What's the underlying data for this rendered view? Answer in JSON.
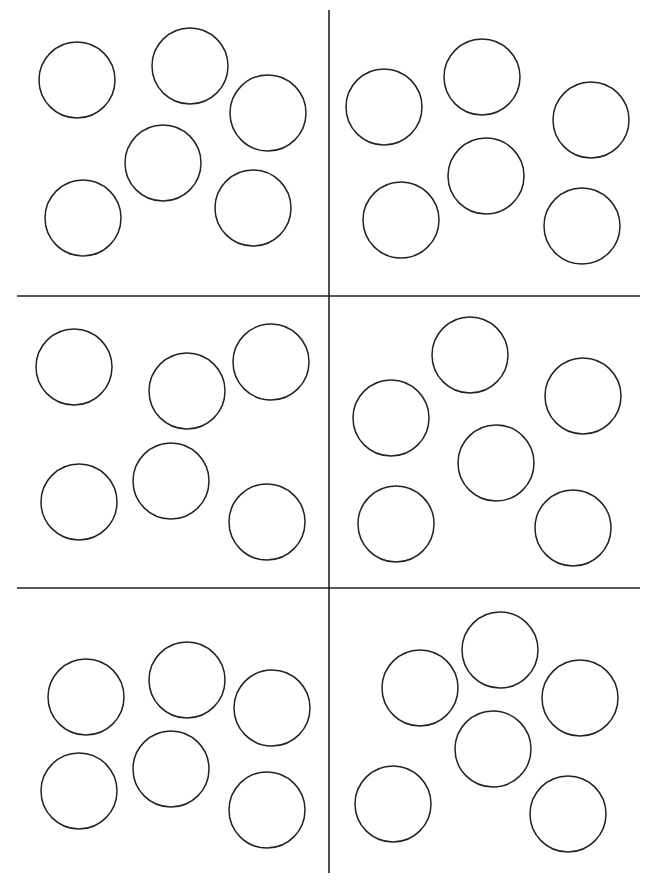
{
  "page": {
    "width": 656,
    "height": 887,
    "background": "#ffffff",
    "stroke_color": "#222222"
  },
  "grid_lines": [
    {
      "id": "vertical-divider",
      "x1": 329,
      "y1": 10,
      "x2": 329,
      "y2": 873
    },
    {
      "id": "horizontal-divider-top",
      "x1": 17,
      "y1": 296,
      "x2": 640,
      "y2": 296
    },
    {
      "id": "horizontal-divider-bottom",
      "x1": 17,
      "y1": 588,
      "x2": 640,
      "y2": 588
    }
  ],
  "circle_radius": 38,
  "panels": [
    {
      "name": "panel-top-left",
      "circles": [
        [
          77,
          80
        ],
        [
          190,
          66
        ],
        [
          268,
          113
        ],
        [
          163,
          163
        ],
        [
          83,
          218
        ],
        [
          253,
          208
        ]
      ]
    },
    {
      "name": "panel-top-right",
      "circles": [
        [
          384,
          107
        ],
        [
          482,
          77
        ],
        [
          591,
          120
        ],
        [
          486,
          176
        ],
        [
          401,
          220
        ],
        [
          582,
          226
        ]
      ]
    },
    {
      "name": "panel-middle-left",
      "circles": [
        [
          74,
          367
        ],
        [
          187,
          391
        ],
        [
          271,
          362
        ],
        [
          79,
          502
        ],
        [
          171,
          481
        ],
        [
          267,
          522
        ]
      ]
    },
    {
      "name": "panel-middle-right",
      "circles": [
        [
          470,
          355
        ],
        [
          391,
          418
        ],
        [
          583,
          396
        ],
        [
          496,
          463
        ],
        [
          396,
          524
        ],
        [
          573,
          528
        ]
      ]
    },
    {
      "name": "panel-bottom-left",
      "circles": [
        [
          86,
          697
        ],
        [
          187,
          680
        ],
        [
          272,
          708
        ],
        [
          79,
          791
        ],
        [
          171,
          769
        ],
        [
          267,
          810
        ]
      ]
    },
    {
      "name": "panel-bottom-right",
      "circles": [
        [
          500,
          650
        ],
        [
          420,
          688
        ],
        [
          580,
          698
        ],
        [
          493,
          749
        ],
        [
          393,
          804
        ],
        [
          568,
          814
        ]
      ]
    }
  ]
}
